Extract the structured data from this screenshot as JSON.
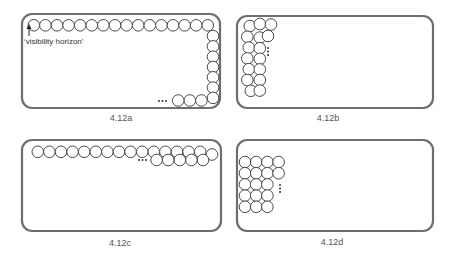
{
  "colors": {
    "frame": "#6e6e6e",
    "circle_stroke": "#4a4a4a",
    "text": "#555555"
  },
  "panels": [
    {
      "id": "a",
      "label": "4.12a",
      "frame": {
        "x": 22,
        "y": 14,
        "w": 198,
        "h": 94,
        "r": 10
      },
      "label_pos": {
        "x": 121,
        "y": 113
      },
      "annotation": "‘visibility horizon’",
      "description": "Single row of circles along top edge, then down the right edge, then along the bottom edge leftward with ellipsis"
    },
    {
      "id": "b",
      "label": "4.12b",
      "frame": {
        "x": 237,
        "y": 16,
        "w": 196,
        "h": 92,
        "r": 10
      },
      "label_pos": {
        "x": 328,
        "y": 113
      },
      "description": "Staggered columns of circles stacked down the left edge, third column partial with vertical ellipsis"
    },
    {
      "id": "c",
      "label": "4.12c",
      "frame": {
        "x": 22,
        "y": 140,
        "w": 199,
        "h": 91,
        "r": 10
      },
      "label_pos": {
        "x": 120,
        "y": 238
      },
      "description": "Full row of circles along top edge, second staggered row growing leftward from the right with ellipsis"
    },
    {
      "id": "d",
      "label": "4.12d",
      "frame": {
        "x": 237,
        "y": 140,
        "w": 196,
        "h": 91,
        "r": 10
      },
      "label_pos": {
        "x": 332,
        "y": 237
      },
      "description": "Square grid of circles in the upper-left, 4 columns in first two rows, 3 columns below, vertical ellipsis"
    }
  ]
}
